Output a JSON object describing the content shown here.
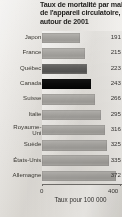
{
  "chart_data": {
    "type": "bar",
    "orientation": "horizontal",
    "title": "Taux de mortalité par maladie de l'appareil circulatoire, autour de 2001",
    "title_lines": [
      "Taux de mortalité par maladie",
      "de l'appareil circulatoire,",
      "autour de 2001"
    ],
    "xlabel": "Taux pour 100 000",
    "ylabel": "",
    "xlim": [
      0,
      400
    ],
    "xticks": [
      0,
      400
    ],
    "xtick_labels": [
      "0",
      "400"
    ],
    "grid": false,
    "legend": "none",
    "categories": [
      "Japon",
      "France",
      "Québec",
      "Canada",
      "Suisse",
      "Italie",
      "Royaume-Uni",
      "Suède",
      "États-Unis",
      "Allemagne"
    ],
    "values": [
      191,
      215,
      223,
      243,
      266,
      295,
      316,
      325,
      335,
      372
    ],
    "value_labels": [
      "191",
      "215",
      "223",
      "243",
      "266",
      "295",
      "316",
      "325",
      "335",
      "372"
    ],
    "highlight": {
      "Canada": "black",
      "Québec": "dark-gray"
    },
    "colors": {
      "bar_default": "#a8a6a2",
      "bar_dark": "#5b5a58",
      "bar_highlight": "#000000",
      "panel_background": "#e8e5e0",
      "axis": "#6d6b68",
      "text": "#343230"
    }
  },
  "rows": [
    {
      "label": "Japon",
      "label_line2": "",
      "value": "191",
      "shade": "normal"
    },
    {
      "label": "France",
      "label_line2": "",
      "value": "215",
      "shade": "normal"
    },
    {
      "label": "Québec",
      "label_line2": "",
      "value": "223",
      "shade": "dark"
    },
    {
      "label": "Canada",
      "label_line2": "",
      "value": "243",
      "shade": "black"
    },
    {
      "label": "Suisse",
      "label_line2": "",
      "value": "266",
      "shade": "normal"
    },
    {
      "label": "Italie",
      "label_line2": "",
      "value": "295",
      "shade": "normal"
    },
    {
      "label": "Royaume-",
      "label_line2": "Uni",
      "value": "316",
      "shade": "normal"
    },
    {
      "label": "Suède",
      "label_line2": "",
      "value": "325",
      "shade": "normal"
    },
    {
      "label": "États-Unis",
      "label_line2": "",
      "value": "335",
      "shade": "normal"
    },
    {
      "label": "Allemagne",
      "label_line2": "",
      "value": "372",
      "shade": "normal"
    }
  ],
  "axis": {
    "tick_min": "0",
    "tick_max": "400",
    "caption": "Taux pour 100 000"
  }
}
